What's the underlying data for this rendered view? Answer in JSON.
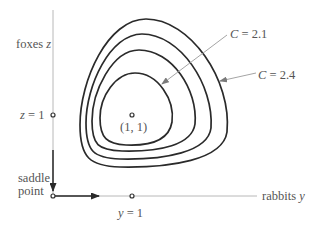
{
  "diagram": {
    "axes": {
      "vertical_label_text": "foxes ",
      "vertical_label_var": "z",
      "horizontal_label_text": "rabbits ",
      "horizontal_label_var": "y"
    },
    "markers": {
      "z1_var": "z",
      "z1_rest": " = 1",
      "y1_var": "y",
      "y1_rest": " = 1",
      "center_label": "(1, 1)",
      "saddle_line1": "saddle",
      "saddle_line2": "point"
    },
    "annotations": {
      "inner_c_var": "C",
      "inner_c_rest": " = 2.1",
      "outer_c_var": "C",
      "outer_c_rest": " = 2.4"
    },
    "curves": [
      {
        "name": "innermost-orbit",
        "C": "2.1"
      },
      {
        "name": "orbit-2"
      },
      {
        "name": "orbit-3"
      },
      {
        "name": "outermost-orbit",
        "C": "2.4"
      }
    ],
    "colors": {
      "curve": "#2a2a2a",
      "axis": "#b8b8b8",
      "text": "#555555",
      "pointer": "#9a9a9a"
    }
  }
}
